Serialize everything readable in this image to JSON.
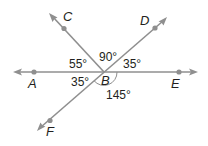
{
  "diagram": {
    "type": "geometry-angles",
    "vertex": "B",
    "points": {
      "A": "A",
      "B": "B",
      "C": "C",
      "D": "D",
      "E": "E",
      "F": "F"
    },
    "angles": {
      "ABC": "55°",
      "CBD": "90°",
      "DBE": "35°",
      "ABF": "35°",
      "FBE": "145°"
    },
    "colors": {
      "line": "#8f8f8f",
      "text": "#231f20",
      "background": "#ffffff"
    }
  }
}
